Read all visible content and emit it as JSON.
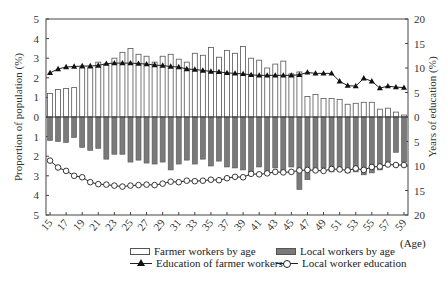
{
  "chart_data": {
    "type": "bar",
    "title": "",
    "xlabel": "(Age)",
    "ylabel": "Proportion of population (%)",
    "ylabel_right": "Years of education (%)",
    "ylim": [
      -5,
      5
    ],
    "ylim_right": [
      -20,
      20
    ],
    "yticks_left": [
      "5",
      "4",
      "3",
      "2",
      "1",
      "0",
      "1",
      "2",
      "3",
      "4",
      "5"
    ],
    "yticks_right": [
      "20",
      "15",
      "10",
      "5",
      "0",
      "5",
      "10",
      "15",
      "20"
    ],
    "xtick_labels": [
      "15",
      "17",
      "19",
      "21",
      "23",
      "25",
      "27",
      "29",
      "31",
      "33",
      "35",
      "37",
      "39",
      "41",
      "43",
      "45",
      "47",
      "49",
      "51",
      "53",
      "55",
      "57",
      "59"
    ],
    "categories": [
      15,
      16,
      17,
      18,
      19,
      20,
      21,
      22,
      23,
      24,
      25,
      26,
      27,
      28,
      29,
      30,
      31,
      32,
      33,
      34,
      35,
      36,
      37,
      38,
      39,
      40,
      41,
      42,
      43,
      44,
      45,
      46,
      47,
      48,
      49,
      50,
      51,
      52,
      53,
      54,
      55,
      56,
      57,
      58,
      59
    ],
    "series": [
      {
        "name": "Farmer workers by age",
        "kind": "bar-up",
        "axis": "left",
        "values": [
          1.2,
          1.4,
          1.45,
          1.5,
          2.5,
          2.5,
          2.8,
          2.7,
          3.0,
          3.3,
          3.5,
          3.2,
          3.1,
          2.8,
          3.1,
          3.2,
          2.95,
          2.8,
          3.25,
          3.15,
          3.55,
          3.05,
          3.4,
          3.25,
          3.6,
          3.0,
          2.9,
          2.5,
          2.7,
          2.85,
          2.2,
          2.3,
          1.05,
          1.15,
          0.95,
          0.95,
          0.9,
          0.65,
          0.7,
          0.75,
          0.75,
          0.4,
          0.45,
          0.25,
          0.1
        ]
      },
      {
        "name": "Local workers by age",
        "kind": "bar-down",
        "axis": "left",
        "values": [
          1.2,
          1.25,
          1.3,
          1.05,
          1.55,
          1.7,
          1.6,
          2.15,
          1.9,
          1.9,
          2.3,
          2.2,
          2.35,
          2.4,
          2.3,
          2.7,
          2.4,
          2.2,
          2.4,
          2.15,
          2.5,
          2.25,
          2.55,
          2.6,
          2.7,
          2.8,
          2.55,
          2.85,
          2.6,
          2.75,
          2.55,
          3.7,
          3.2,
          2.75,
          2.6,
          2.8,
          2.7,
          2.85,
          2.8,
          2.95,
          2.85,
          2.7,
          2.3,
          1.8,
          2.3
        ]
      },
      {
        "name": "Education of farmer workers",
        "kind": "line-up-triangle",
        "axis": "right",
        "values": [
          9.0,
          9.8,
          10.2,
          10.3,
          10.4,
          10.4,
          10.5,
          10.9,
          11.0,
          11.0,
          11.0,
          10.9,
          10.8,
          10.6,
          10.5,
          10.3,
          10.2,
          9.8,
          9.7,
          9.5,
          9.3,
          9.2,
          9.0,
          8.9,
          8.8,
          8.6,
          8.5,
          8.5,
          8.5,
          8.5,
          8.5,
          8.6,
          9.1,
          8.9,
          8.9,
          8.9,
          7.3,
          6.4,
          6.3,
          7.9,
          7.3,
          5.9,
          6.3,
          6.1,
          6.0
        ]
      },
      {
        "name": "Local worker education",
        "kind": "line-down-circle",
        "axis": "right",
        "values": [
          8.9,
          10.3,
          11.0,
          12.0,
          12.3,
          13.3,
          13.7,
          13.8,
          14.0,
          14.2,
          14.0,
          13.9,
          13.8,
          13.9,
          13.6,
          13.2,
          13.3,
          13.0,
          13.1,
          13.0,
          12.8,
          12.9,
          12.5,
          12.2,
          12.3,
          11.6,
          11.7,
          11.5,
          11.2,
          11.3,
          11.2,
          10.9,
          10.8,
          10.9,
          11.0,
          10.6,
          10.7,
          10.9,
          10.5,
          10.8,
          10.2,
          10.1,
          9.7,
          9.8,
          9.8
        ]
      }
    ],
    "legend_position": "bottom",
    "grid": false
  },
  "legend": {
    "farmer_bar": "Farmer workers by age",
    "local_bar": "Local workers by age",
    "farmer_edu": "Education of farmer workers",
    "local_edu": "Local worker education"
  },
  "axis_labels": {
    "left": "Proportion of population (%)",
    "right": "Years of education (%)",
    "x": "(Age)"
  },
  "colors": {
    "farmer_bar_fill": "#ffffff",
    "local_bar_fill": "#7a7a7a",
    "bar_stroke": "#555555",
    "line": "#222222"
  }
}
